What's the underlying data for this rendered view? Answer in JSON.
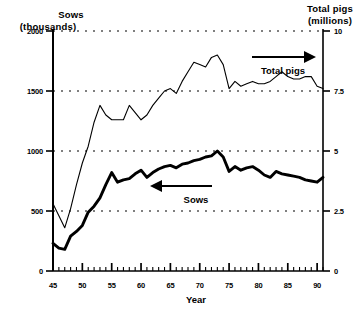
{
  "chart_data": {
    "type": "line",
    "title": "",
    "xlabel": "Year",
    "ylabel_left_line1": "Sows",
    "ylabel_left_line2": "(thousands)",
    "ylabel_right_line1": "Total pigs",
    "ylabel_right_line2": "(millions)",
    "xlim": [
      45,
      91
    ],
    "xticks_major": [
      45,
      50,
      55,
      60,
      65,
      70,
      75,
      80,
      85,
      90
    ],
    "xtick_labels": [
      "45",
      "50",
      "55",
      "60",
      "65",
      "70",
      "75",
      "80",
      "85",
      "90"
    ],
    "ylim_left": [
      0,
      2000
    ],
    "yticks_left": [
      0,
      500,
      1000,
      1500,
      2000
    ],
    "ytick_labels_left": [
      "0",
      "500",
      "1000",
      "1500",
      "2000"
    ],
    "ylim_right": [
      0,
      10
    ],
    "yticks_right": [
      0,
      2.5,
      5,
      7.5,
      10
    ],
    "ytick_labels_right": [
      "0",
      "2.5",
      "5",
      "7.5",
      "10"
    ],
    "grid": true,
    "grid_style": "dotted-horizontal",
    "legend": "inline-arrow-annotations",
    "annotations": [
      {
        "text": "Total pigs",
        "arrow": "right",
        "points_to": "total-pigs-series"
      },
      {
        "text": "Sows",
        "arrow": "left",
        "points_to": "sows-series"
      }
    ],
    "series": [
      {
        "name": "Total pigs",
        "axis": "right",
        "unit": "millions",
        "line_width": "thin",
        "x": [
          45,
          46,
          47,
          48,
          49,
          50,
          51,
          52,
          53,
          54,
          55,
          56,
          57,
          58,
          59,
          60,
          61,
          62,
          63,
          64,
          65,
          66,
          67,
          68,
          69,
          70,
          71,
          72,
          73,
          74,
          75,
          76,
          77,
          78,
          79,
          80,
          81,
          82,
          83,
          84,
          85,
          86,
          87,
          88,
          89,
          90,
          91
        ],
        "values": [
          2.8,
          2.3,
          1.8,
          2.6,
          3.6,
          4.5,
          5.2,
          6.2,
          6.9,
          6.5,
          6.3,
          6.3,
          6.3,
          6.9,
          6.6,
          6.3,
          6.5,
          6.9,
          7.2,
          7.5,
          7.6,
          7.4,
          7.9,
          8.3,
          8.7,
          8.6,
          8.5,
          8.9,
          9.0,
          8.6,
          7.6,
          7.9,
          7.7,
          7.8,
          7.9,
          7.8,
          7.8,
          7.9,
          8.1,
          8.3,
          8.1,
          8.0,
          8.0,
          8.1,
          8.1,
          7.7,
          7.6
        ]
      },
      {
        "name": "Sows",
        "axis": "left",
        "unit": "thousands",
        "line_width": "thick",
        "x": [
          45,
          46,
          47,
          48,
          49,
          50,
          51,
          52,
          53,
          54,
          55,
          56,
          57,
          58,
          59,
          60,
          61,
          62,
          63,
          64,
          65,
          66,
          67,
          68,
          69,
          70,
          71,
          72,
          73,
          74,
          75,
          76,
          77,
          78,
          79,
          80,
          81,
          82,
          83,
          84,
          85,
          86,
          87,
          88,
          89,
          90,
          91
        ],
        "values": [
          230,
          190,
          180,
          290,
          330,
          380,
          490,
          540,
          610,
          720,
          820,
          740,
          760,
          770,
          810,
          840,
          780,
          820,
          850,
          870,
          880,
          860,
          890,
          900,
          920,
          930,
          950,
          960,
          1000,
          950,
          830,
          870,
          840,
          860,
          870,
          840,
          800,
          780,
          830,
          810,
          800,
          790,
          780,
          760,
          750,
          740,
          780
        ]
      }
    ]
  }
}
